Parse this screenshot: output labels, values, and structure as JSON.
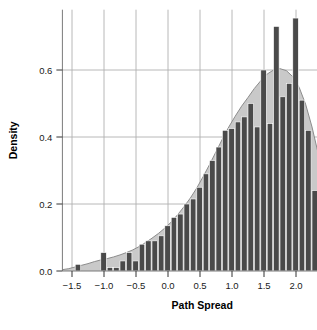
{
  "figure": {
    "background_color": "#ffffff",
    "top_cropped_text": " "
  },
  "chart_data": {
    "type": "bar",
    "title": "",
    "subtitle": "",
    "xlabel": "Path Spread",
    "ylabel": "Density",
    "xlim": [
      -1.65,
      2.72
    ],
    "ylim": [
      0.0,
      0.78
    ],
    "grid": true,
    "grid_color": "#b0b0b0",
    "legend": null,
    "bar_color": "#4a4a4a",
    "bar_edge_color": "#ffffff",
    "kde_fill_color": "#c9c9c9",
    "kde_line_color": "#8c8c8c",
    "xticks": [
      -1.5,
      -1.0,
      -0.5,
      0.0,
      0.5,
      1.0,
      1.5,
      2.0,
      2.5
    ],
    "xticklabels": [
      "−1.5",
      "−1.0",
      "−0.5",
      "0.0",
      "0.5",
      "1.0",
      "1.5",
      "2.0",
      "2.5"
    ],
    "yticks": [
      0.0,
      0.2,
      0.4,
      0.6
    ],
    "yticklabels": [
      "0.0",
      "0.2",
      "0.4",
      "0.6"
    ],
    "bin_width": 0.1,
    "bin_left_edges": [
      -1.45,
      -1.35,
      -1.25,
      -1.15,
      -1.05,
      -0.95,
      -0.85,
      -0.75,
      -0.65,
      -0.55,
      -0.45,
      -0.35,
      -0.25,
      -0.15,
      -0.05,
      0.05,
      0.15,
      0.25,
      0.35,
      0.45,
      0.55,
      0.65,
      0.75,
      0.85,
      0.95,
      1.05,
      1.15,
      1.25,
      1.35,
      1.45,
      1.55,
      1.65,
      1.75,
      1.85,
      1.95,
      2.05,
      2.15,
      2.25,
      2.35,
      2.45
    ],
    "bin_centers": [
      -1.4,
      -1.3,
      -1.2,
      -1.1,
      -1.0,
      -0.9,
      -0.8,
      -0.7,
      -0.6,
      -0.5,
      -0.4,
      -0.3,
      -0.2,
      -0.1,
      0.0,
      0.1,
      0.2,
      0.3,
      0.4,
      0.5,
      0.6,
      0.7,
      0.8,
      0.9,
      1.0,
      1.1,
      1.2,
      1.3,
      1.4,
      1.5,
      1.6,
      1.7,
      1.8,
      1.9,
      2.0,
      2.1,
      2.2,
      2.3,
      2.4,
      2.5
    ],
    "values": [
      0.02,
      0.0,
      0.0,
      0.0,
      0.055,
      0.01,
      0.01,
      0.03,
      0.055,
      0.03,
      0.08,
      0.09,
      0.09,
      0.105,
      0.135,
      0.16,
      0.17,
      0.2,
      0.215,
      0.25,
      0.29,
      0.33,
      0.37,
      0.42,
      0.425,
      0.445,
      0.46,
      0.5,
      0.43,
      0.6,
      0.44,
      0.73,
      0.52,
      0.56,
      0.755,
      0.51,
      0.42,
      0.24,
      0.1,
      0.07
    ],
    "kde": {
      "x": [
        -1.65,
        -1.55,
        -1.45,
        -1.35,
        -1.25,
        -1.15,
        -1.05,
        -0.95,
        -0.85,
        -0.75,
        -0.65,
        -0.55,
        -0.45,
        -0.35,
        -0.25,
        -0.15,
        -0.05,
        0.05,
        0.15,
        0.25,
        0.35,
        0.45,
        0.55,
        0.65,
        0.75,
        0.85,
        0.95,
        1.05,
        1.15,
        1.25,
        1.35,
        1.45,
        1.55,
        1.65,
        1.75,
        1.85,
        1.95,
        2.05,
        2.15,
        2.25,
        2.35,
        2.45,
        2.55,
        2.65,
        2.72
      ],
      "y": [
        0.004,
        0.007,
        0.012,
        0.017,
        0.022,
        0.028,
        0.033,
        0.037,
        0.042,
        0.048,
        0.055,
        0.063,
        0.073,
        0.085,
        0.098,
        0.112,
        0.128,
        0.146,
        0.168,
        0.192,
        0.218,
        0.248,
        0.282,
        0.318,
        0.356,
        0.394,
        0.43,
        0.462,
        0.492,
        0.518,
        0.545,
        0.568,
        0.588,
        0.6,
        0.604,
        0.598,
        0.58,
        0.548,
        0.498,
        0.43,
        0.348,
        0.258,
        0.166,
        0.09,
        0.05
      ]
    }
  },
  "axes": {
    "x_axis_name": "path-spread-axis",
    "y_axis_name": "density-axis"
  }
}
